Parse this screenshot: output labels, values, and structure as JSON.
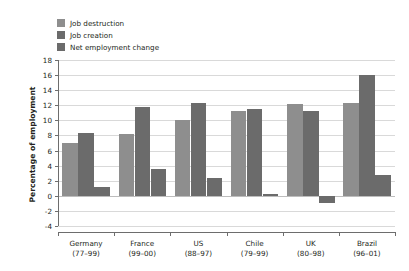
{
  "chart_data": {
    "type": "bar",
    "title": "",
    "subtitle": "",
    "xlabel": "",
    "ylabel": "Percentage of employment",
    "ylim": [
      -4,
      18
    ],
    "ytick_step": 2,
    "yticks": [
      18,
      16,
      14,
      12,
      10,
      8,
      6,
      4,
      2,
      0,
      -2,
      -4
    ],
    "ytick_labels": [
      "18",
      "16",
      "14",
      "12",
      "10",
      "8",
      "6",
      "4",
      "2",
      "0",
      "-2",
      "-4"
    ],
    "grid": true,
    "grid_axis": "y",
    "legend_position": "top-left",
    "categories": [
      {
        "name": "Germany",
        "period": "(77–99)"
      },
      {
        "name": "France",
        "period": "(99–00)"
      },
      {
        "name": "US",
        "period": "(88–97)"
      },
      {
        "name": "Chile",
        "period": "(79–99)"
      },
      {
        "name": "UK",
        "period": "(80–98)"
      },
      {
        "name": "Brazil",
        "period": "(96–01)"
      }
    ],
    "series": [
      {
        "name": "Job destruction",
        "color": "#8e8e8e",
        "values": [
          7.0,
          8.2,
          10.0,
          11.2,
          12.2,
          12.3
        ]
      },
      {
        "name": "Job creation",
        "color": "#6b6b6b",
        "values": [
          8.3,
          11.8,
          12.3,
          11.5,
          11.2,
          16.0
        ]
      },
      {
        "name": "Net employment change",
        "color": "#6b6b6b",
        "values": [
          1.2,
          3.6,
          2.3,
          0.3,
          -1.0,
          2.7
        ]
      }
    ]
  },
  "colors": {
    "axis": "#6d6d6d",
    "gridline": "#d9d9d9",
    "zero_line": "#bdbdbd",
    "text": "#231f20",
    "background": "#ffffff"
  }
}
